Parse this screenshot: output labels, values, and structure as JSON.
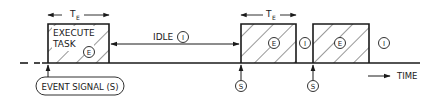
{
  "diagram": {
    "colors": {
      "ink": "#1a1a1a",
      "background": "#ffffff"
    },
    "labels": {
      "execute_line1": "EXECUTE",
      "execute_line2": "TASK",
      "idle": "IDLE",
      "time": "TIME",
      "event_signal": "EVENT SIGNAL (S)",
      "te_main": "T",
      "te_sub": "E",
      "exec_marker": "E",
      "idle_marker": "I",
      "signal_marker": "S"
    },
    "tasks": [
      {
        "name": "task-1",
        "x_start": 48,
        "x_end": 109
      },
      {
        "name": "task-2",
        "x_start": 241,
        "x_end": 296
      },
      {
        "name": "task-3",
        "x_start": 313,
        "x_end": 369
      }
    ],
    "signals": [
      {
        "name": "signal-1",
        "x": 48
      },
      {
        "name": "signal-2",
        "x": 241
      },
      {
        "name": "signal-3",
        "x": 313
      }
    ]
  }
}
